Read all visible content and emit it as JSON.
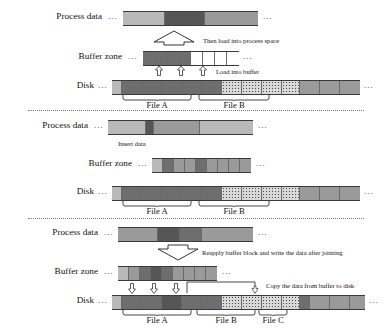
{
  "figure": {
    "colors": {
      "light": "#b9b9b9",
      "mid": "#9a9a9a",
      "dark": "#6e6e6e",
      "darker": "#565656",
      "speckle": "#d8d8d8",
      "rule": "#3a3a3a"
    }
  },
  "labels": {
    "process_data": "Process data",
    "buffer_zone": "Buffer zone",
    "disk": "Disk",
    "ellipsis": "...",
    "file_a": "File A",
    "file_b": "File B",
    "file_c": "File C"
  },
  "panels": [
    {
      "id": "panel-load",
      "notes": {
        "big_arrow": "Then load into process space",
        "small_arrows": "Load into buffer"
      },
      "rows": {
        "process_data": {
          "cells": [
            {
              "fill": "light",
              "w": 42
            },
            {
              "fill": "darker",
              "w": 40
            },
            {
              "fill": "mid",
              "w": 53
            }
          ]
        },
        "buffer_zone": {
          "cells": [
            {
              "fill": "dark",
              "w": 12
            },
            {
              "fill": "dark",
              "w": 12
            },
            {
              "fill": "dark",
              "w": 12
            },
            {
              "fill": "dark",
              "w": 12
            },
            {
              "fill": "empty",
              "w": 12
            },
            {
              "fill": "empty",
              "w": 12
            },
            {
              "fill": "empty",
              "w": 12
            },
            {
              "fill": "empty",
              "w": 12
            }
          ]
        },
        "disk": {
          "cells": [
            {
              "fill": "light",
              "w": 10
            },
            {
              "fill": "dark",
              "w": 20
            },
            {
              "fill": "dark",
              "w": 20
            },
            {
              "fill": "dark",
              "w": 20
            },
            {
              "fill": "dark",
              "w": 20
            },
            {
              "fill": "dark",
              "w": 20
            },
            {
              "fill": "speck",
              "w": 20
            },
            {
              "fill": "speck",
              "w": 20
            },
            {
              "fill": "speck",
              "w": 20
            },
            {
              "fill": "speck",
              "w": 18
            },
            {
              "fill": "mid",
              "w": 20
            },
            {
              "fill": "mid",
              "w": 20
            },
            {
              "fill": "mid",
              "w": 20
            }
          ]
        }
      },
      "braces": [
        {
          "label": "File A",
          "x": 120,
          "w": 70
        },
        {
          "label": "File B",
          "x": 196,
          "w": 72
        }
      ]
    },
    {
      "id": "panel-insert",
      "notes": {
        "insert": "Insert data"
      },
      "rows": {
        "process_data": {
          "cells": [
            {
              "fill": "light",
              "w": 38
            },
            {
              "fill": "darker",
              "w": 8
            },
            {
              "fill": "mid",
              "w": 46
            },
            {
              "fill": "light",
              "w": 53
            }
          ]
        },
        "buffer_zone": {
          "cells": [
            {
              "fill": "light",
              "w": 11
            },
            {
              "fill": "dark",
              "w": 11
            },
            {
              "fill": "mid",
              "w": 11
            },
            {
              "fill": "mid",
              "w": 11
            },
            {
              "fill": "dark",
              "w": 11
            },
            {
              "fill": "mid",
              "w": 11
            },
            {
              "fill": "mid",
              "w": 11
            },
            {
              "fill": "mid",
              "w": 11
            },
            {
              "fill": "mid",
              "w": 11
            }
          ]
        },
        "disk": {
          "cells": [
            {
              "fill": "light",
              "w": 10
            },
            {
              "fill": "dark",
              "w": 20
            },
            {
              "fill": "dark",
              "w": 20
            },
            {
              "fill": "dark",
              "w": 20
            },
            {
              "fill": "dark",
              "w": 20
            },
            {
              "fill": "dark",
              "w": 20
            },
            {
              "fill": "speck",
              "w": 20
            },
            {
              "fill": "speck",
              "w": 20
            },
            {
              "fill": "speck",
              "w": 20
            },
            {
              "fill": "speck",
              "w": 18
            },
            {
              "fill": "mid",
              "w": 20
            },
            {
              "fill": "mid",
              "w": 20
            },
            {
              "fill": "mid",
              "w": 20
            }
          ]
        }
      },
      "braces": [
        {
          "label": "File A",
          "x": 120,
          "w": 70
        },
        {
          "label": "File B",
          "x": 196,
          "w": 72
        }
      ]
    },
    {
      "id": "panel-writeback",
      "notes": {
        "big_arrow": "Reapply buffer block and write the data after jointing",
        "small_arrows": "",
        "connector": "Copy the data from buffer to disk"
      },
      "rows": {
        "process_data": {
          "cells": [
            {
              "fill": "mid",
              "w": 40
            },
            {
              "fill": "darker",
              "w": 22
            },
            {
              "fill": "dark",
              "w": 22
            },
            {
              "fill": "mid",
              "w": 51
            }
          ]
        },
        "buffer_zone": {
          "cells": [
            {
              "fill": "light",
              "w": 11
            },
            {
              "fill": "mid",
              "w": 11
            },
            {
              "fill": "dark",
              "w": 11
            },
            {
              "fill": "darker",
              "w": 11
            },
            {
              "fill": "dark",
              "w": 11
            },
            {
              "fill": "mid",
              "w": 11
            },
            {
              "fill": "mid",
              "w": 11
            },
            {
              "fill": "mid",
              "w": 11
            },
            {
              "fill": "mid",
              "w": 11
            }
          ]
        },
        "disk": {
          "cells": [
            {
              "fill": "light",
              "w": 10
            },
            {
              "fill": "dark",
              "w": 20
            },
            {
              "fill": "dark",
              "w": 20
            },
            {
              "fill": "darker",
              "w": 20
            },
            {
              "fill": "dark",
              "w": 20
            },
            {
              "fill": "dark",
              "w": 20
            },
            {
              "fill": "speck",
              "w": 20
            },
            {
              "fill": "speck",
              "w": 20
            },
            {
              "fill": "speck",
              "w": 20
            },
            {
              "fill": "speck",
              "w": 18
            },
            {
              "fill": "dark",
              "w": 10
            },
            {
              "fill": "mid",
              "w": 20
            },
            {
              "fill": "mid",
              "w": 20
            },
            {
              "fill": "mid",
              "w": 15
            }
          ]
        }
      },
      "braces": [
        {
          "label": "File A",
          "x": 120,
          "w": 70
        },
        {
          "label": "File B",
          "x": 196,
          "w": 60
        },
        {
          "label": "File C",
          "x": 258,
          "w": 30
        }
      ]
    }
  ]
}
